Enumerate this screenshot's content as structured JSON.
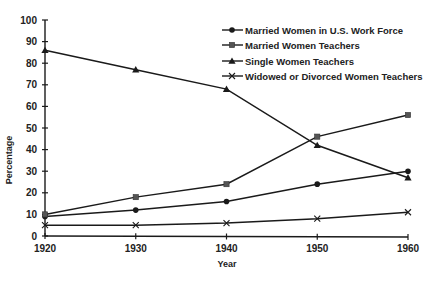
{
  "chart_data": {
    "type": "line",
    "title": "",
    "xlabel": "Year",
    "ylabel": "Percentage",
    "x": [
      1920,
      1930,
      1940,
      1950,
      1960
    ],
    "ylim": [
      0,
      100
    ],
    "yticks": [
      0,
      10,
      20,
      30,
      40,
      50,
      60,
      70,
      80,
      90,
      100
    ],
    "grid": false,
    "legend_position": "upper right",
    "series": [
      {
        "name": "Married Women in U.S. Work Force",
        "marker": "circle",
        "values": [
          9,
          12,
          16,
          24,
          30
        ]
      },
      {
        "name": "Married Women Teachers",
        "marker": "square",
        "values": [
          10,
          18,
          24,
          46,
          56
        ]
      },
      {
        "name": "Single Women Teachers",
        "marker": "triangle",
        "values": [
          86,
          77,
          68,
          42,
          27
        ]
      },
      {
        "name": "Widowed or Divorced Women Teachers",
        "marker": "x",
        "values": [
          5,
          5,
          6,
          8,
          11
        ]
      }
    ]
  }
}
